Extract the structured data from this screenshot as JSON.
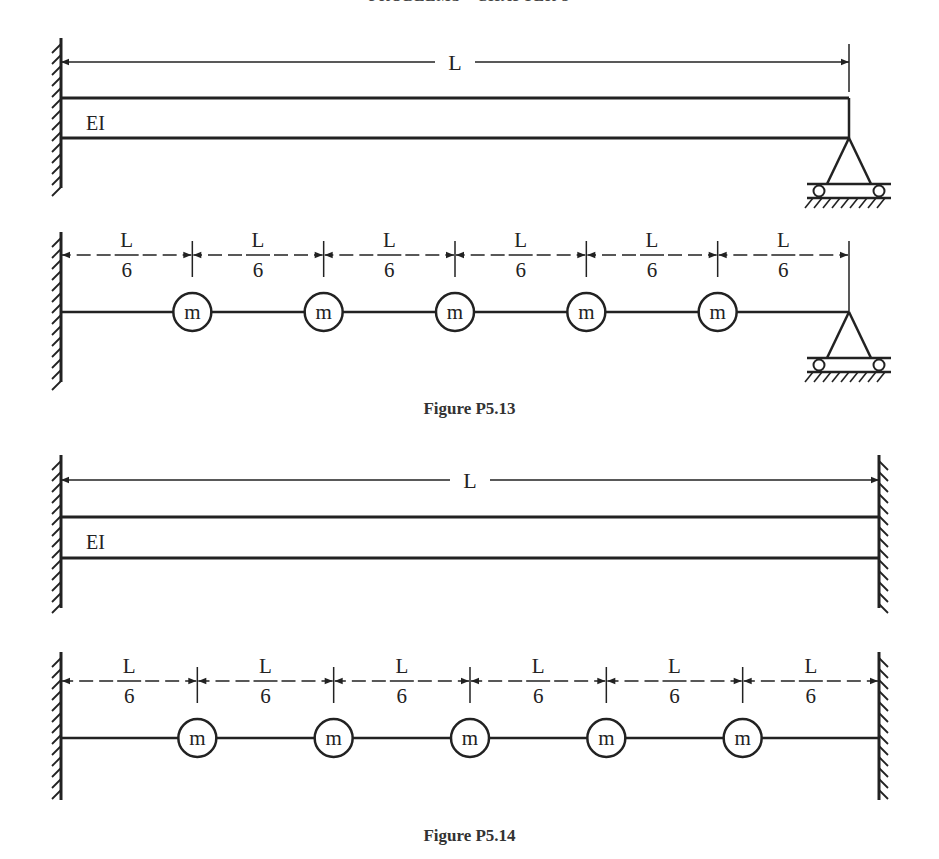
{
  "header": {
    "running_title": "PROBLEMS · CHAPTER 5"
  },
  "figure_p5_13": {
    "caption": "Figure P5.13",
    "continuous": {
      "length_label": "L",
      "stiffness_label": "EI",
      "left_support": "fixed",
      "right_support": "roller/pin"
    },
    "lumped": {
      "segment_labels": [
        {
          "num": "L",
          "den": "6"
        },
        {
          "num": "L",
          "den": "6"
        },
        {
          "num": "L",
          "den": "6"
        },
        {
          "num": "L",
          "den": "6"
        },
        {
          "num": "L",
          "den": "6"
        },
        {
          "num": "L",
          "den": "6"
        }
      ],
      "masses": [
        "m",
        "m",
        "m",
        "m",
        "m"
      ],
      "left_support": "fixed",
      "right_support": "roller/pin"
    }
  },
  "figure_p5_14": {
    "caption": "Figure P5.14",
    "continuous": {
      "length_label": "L",
      "stiffness_label": "EI",
      "left_support": "fixed",
      "right_support": "fixed"
    },
    "lumped": {
      "segment_labels": [
        {
          "num": "L",
          "den": "6"
        },
        {
          "num": "L",
          "den": "6"
        },
        {
          "num": "L",
          "den": "6"
        },
        {
          "num": "L",
          "den": "6"
        },
        {
          "num": "L",
          "den": "6"
        },
        {
          "num": "L",
          "den": "6"
        }
      ],
      "masses": [
        "m",
        "m",
        "m",
        "m",
        "m"
      ],
      "left_support": "fixed",
      "right_support": "fixed"
    }
  }
}
